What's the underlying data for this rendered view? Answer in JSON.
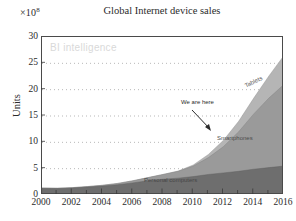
{
  "chart_data": {
    "type": "area",
    "title": "Global Internet device sales",
    "xlabel": "",
    "ylabel": "Units",
    "exponent_label": "×10",
    "exponent_value": "8",
    "watermark": "BI intelligence",
    "grid": true,
    "grid_style": "dotted",
    "legend_position": "inline-labels",
    "xlim": [
      2000,
      2016
    ],
    "ylim": [
      0,
      30
    ],
    "xticks": [
      "2000",
      "2002",
      "2004",
      "2006",
      "2008",
      "2010",
      "2012",
      "2014",
      "2016"
    ],
    "yticks": [
      "0",
      "5",
      "10",
      "15",
      "20",
      "25",
      "30"
    ],
    "x": [
      2000,
      2001,
      2002,
      2003,
      2004,
      2005,
      2006,
      2007,
      2008,
      2009,
      2010,
      2011,
      2012,
      2013,
      2014,
      2015,
      2016
    ],
    "stacked": true,
    "series": [
      {
        "name": "Personal computers",
        "color": "#6e6e6e",
        "values": [
          1.3,
          1.25,
          1.35,
          1.5,
          1.7,
          1.95,
          2.3,
          2.7,
          3.0,
          3.2,
          3.5,
          3.9,
          4.2,
          4.5,
          4.9,
          5.2,
          5.5
        ]
      },
      {
        "name": "Smartphones",
        "color": "#9a9a9a",
        "values": [
          0.0,
          0.02,
          0.05,
          0.1,
          0.15,
          0.25,
          0.4,
          0.6,
          0.9,
          1.3,
          2.0,
          3.2,
          5.0,
          7.5,
          10.5,
          13.2,
          15.5
        ]
      },
      {
        "name": "Tablets",
        "color": "#b5b5b5",
        "values": [
          0.0,
          0.0,
          0.0,
          0.0,
          0.0,
          0.0,
          0.0,
          0.0,
          0.0,
          0.05,
          0.2,
          0.6,
          1.2,
          2.0,
          3.0,
          4.2,
          5.5
        ]
      }
    ],
    "annotations": [
      {
        "text": "We are here",
        "x": 2012,
        "y": 16.5,
        "arrow_to_x": 2012.6,
        "arrow_to_y": 12.5
      }
    ]
  }
}
